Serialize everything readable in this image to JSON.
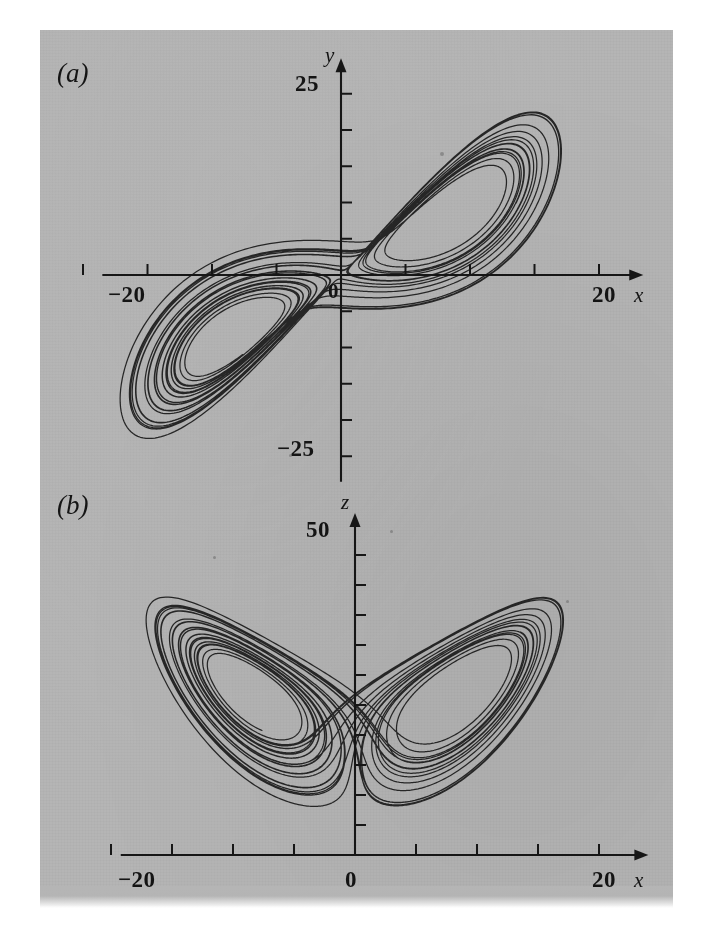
{
  "figure": {
    "background_color": "#ffffff",
    "plate_color": "#b5b5b5",
    "ink_color": "#1a1a1a",
    "panels": [
      {
        "id": "a",
        "letter": "(a)",
        "x_axis": {
          "name": "x",
          "labels": [
            {
              "text": "−20",
              "value": -20
            },
            {
              "text": "20",
              "value": 20
            }
          ],
          "tick_values": [
            -20,
            -15,
            -10,
            -5,
            0,
            5,
            10,
            15,
            20
          ],
          "min": -24,
          "max": 23
        },
        "y_axis": {
          "name": "y",
          "labels": [
            {
              "text": "25",
              "value": 25
            },
            {
              "text": "−25",
              "value": -25
            }
          ],
          "tick_values": [
            25,
            20,
            15,
            10,
            5,
            -5,
            -10,
            -15,
            -20,
            -25
          ],
          "min": -30,
          "max": 29
        },
        "origin_label": "0"
      },
      {
        "id": "b",
        "letter": "(b)",
        "x_axis": {
          "name": "x",
          "labels": [
            {
              "text": "−20",
              "value": -20
            },
            {
              "text": "0",
              "value": 0
            },
            {
              "text": "20",
              "value": 20
            }
          ],
          "tick_values": [
            -20,
            -15,
            -10,
            -5,
            0,
            5,
            10,
            15,
            20
          ],
          "min": -24,
          "max": 23
        },
        "y_axis": {
          "name": "z",
          "labels": [
            {
              "text": "50",
              "value": 50
            }
          ],
          "tick_values": [
            50,
            45,
            40,
            35,
            30,
            25,
            20,
            15,
            10,
            5
          ],
          "min": 0,
          "max": 57
        },
        "origin_label": "0"
      }
    ]
  },
  "chart_data": {
    "type": "line",
    "title": "",
    "system": {
      "name": "Lorenz equations",
      "sigma": 10,
      "rho": 28,
      "beta": 2.6666666667,
      "initial_state": [
        1.0,
        1.0,
        20.0
      ],
      "dt": 0.003,
      "steps": 11000,
      "discard_steps": 900
    },
    "panels": [
      {
        "id": "a",
        "projection": "x-y",
        "xlabel": "x",
        "ylabel": "y",
        "xlim": [
          -24,
          23
        ],
        "ylim": [
          -30,
          29
        ],
        "xticks": [
          -20,
          -15,
          -10,
          -5,
          0,
          5,
          10,
          15,
          20
        ],
        "xtick_labels": [
          "−20",
          "",
          "",
          "",
          "0",
          "",
          "",
          "",
          "20"
        ],
        "yticks": [
          -25,
          -20,
          -15,
          -10,
          -5,
          5,
          10,
          15,
          20,
          25
        ],
        "ytick_labels": [
          "−25",
          "",
          "",
          "",
          "",
          "",
          "",
          "",
          "",
          "25"
        ],
        "grid": false,
        "legend": "none"
      },
      {
        "id": "b",
        "projection": "x-z",
        "xlabel": "x",
        "ylabel": "z",
        "xlim": [
          -24,
          23
        ],
        "ylim": [
          0,
          57
        ],
        "xticks": [
          -20,
          -15,
          -10,
          -5,
          0,
          5,
          10,
          15,
          20
        ],
        "xtick_labels": [
          "−20",
          "",
          "",
          "",
          "0",
          "",
          "",
          "",
          "20"
        ],
        "yticks": [
          5,
          10,
          15,
          20,
          25,
          30,
          35,
          40,
          45,
          50
        ],
        "ytick_labels": [
          "",
          "",
          "",
          "",
          "",
          "",
          "",
          "",
          "",
          "50"
        ],
        "grid": false,
        "legend": "none"
      }
    ]
  }
}
